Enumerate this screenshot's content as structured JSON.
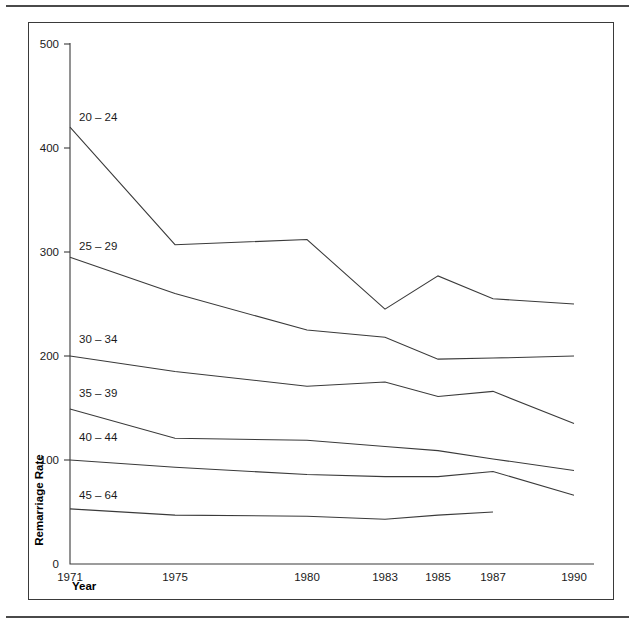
{
  "chart_data": {
    "type": "line",
    "title": "",
    "xlabel": "Year",
    "ylabel": "Remarriage Rate",
    "x": [
      1971,
      1975,
      1980,
      1983,
      1985,
      1987,
      1990
    ],
    "xticklabels": [
      "1971",
      "1975",
      "1980",
      "1983",
      "1985",
      "1987",
      "1990"
    ],
    "yticks": [
      0,
      100,
      200,
      300,
      400,
      500
    ],
    "yticklabels": [
      "0",
      "100",
      "200",
      "300",
      "400",
      "500"
    ],
    "ylim": [
      0,
      515
    ],
    "xlim": [
      1971,
      1990
    ],
    "grid": false,
    "legend": "inline-labels-at-left",
    "line_color": "#3a3a3a",
    "series": [
      {
        "name": "20 – 24",
        "label": "20 – 24",
        "x": [
          1971,
          1975,
          1980,
          1983,
          1985,
          1987,
          1990
        ],
        "values": [
          420,
          307,
          312,
          245,
          277,
          255,
          250
        ]
      },
      {
        "name": "25 – 29",
        "label": "25 – 29",
        "x": [
          1971,
          1975,
          1980,
          1983,
          1985,
          1987,
          1990
        ],
        "values": [
          295,
          260,
          225,
          218,
          197,
          198,
          200
        ]
      },
      {
        "name": "30 – 34",
        "label": "30 – 34",
        "x": [
          1971,
          1975,
          1980,
          1983,
          1985,
          1987,
          1990
        ],
        "values": [
          200,
          185,
          171,
          175,
          161,
          166,
          135
        ]
      },
      {
        "name": "35 – 39",
        "label": "35 – 39",
        "x": [
          1971,
          1975,
          1980,
          1983,
          1985,
          1987,
          1990
        ],
        "values": [
          149,
          121,
          119,
          113,
          109,
          101,
          90
        ]
      },
      {
        "name": "40 – 44",
        "label": "40 – 44",
        "x": [
          1971,
          1975,
          1980,
          1983,
          1985,
          1987,
          1990
        ],
        "values": [
          100,
          93,
          86,
          84,
          84,
          89,
          66
        ]
      },
      {
        "name": "45 – 64",
        "label": "45 – 64",
        "x": [
          1971,
          1975,
          1980,
          1983,
          1985,
          1987
        ],
        "values": [
          53,
          47,
          46,
          43,
          47,
          50
        ]
      }
    ],
    "series_label_positions": [
      {
        "label": "20 – 24",
        "x_px": 78,
        "y_px": 120
      },
      {
        "label": "25 – 29",
        "x_px": 78,
        "y_px": 249
      },
      {
        "label": "30 – 34",
        "x_px": 78,
        "y_px": 342
      },
      {
        "label": "35 – 39",
        "x_px": 78,
        "y_px": 396
      },
      {
        "label": "40 – 44",
        "x_px": 78,
        "y_px": 440
      },
      {
        "label": "45 – 64",
        "x_px": 78,
        "y_px": 498
      }
    ]
  }
}
